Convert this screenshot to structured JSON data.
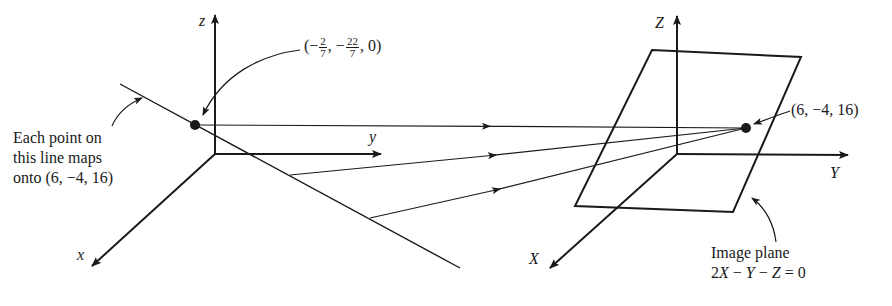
{
  "figure": {
    "left_axes": {
      "x_label": "x",
      "y_label": "y",
      "z_label": "z"
    },
    "right_axes": {
      "x_label": "X",
      "y_label": "Y",
      "z_label": "Z"
    },
    "source_point": {
      "prefix": "(−",
      "frac1_num": "2",
      "frac1_den": "7",
      "mid": ", −",
      "frac2_num": "22",
      "frac2_den": "7",
      "suffix": ", 0)"
    },
    "line_annotation": {
      "line1": "Each point on",
      "line2": "this line maps",
      "line3": "onto (6, −4, 16)"
    },
    "image_point_label": "(6, −4, 16)",
    "plane_annotation": {
      "line1": "Image plane",
      "eq_2": "2",
      "eq_X": "X",
      "eq_m1": " − ",
      "eq_Y": "Y",
      "eq_m2": " − ",
      "eq_Z": "Z",
      "eq_end": " = 0"
    },
    "colors": {
      "ink": "#1a1a1a",
      "background": "#ffffff"
    }
  }
}
